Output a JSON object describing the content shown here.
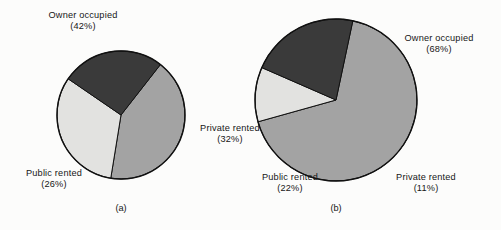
{
  "figure": {
    "background": "#fcfcfb",
    "outline_color": "#111111"
  },
  "palette": {
    "owner_occupied": "#a3a3a3",
    "private_rented": "#e2e2e0",
    "public_rented": "#3a3a3a"
  },
  "captions": {
    "left": "(a)",
    "right": "(b)"
  },
  "labels": {
    "a_owner_name": "Owner occupied",
    "a_owner_pct": "(42%)",
    "a_private_name": "Private rented",
    "a_private_pct": "(32%)",
    "a_public_name": "Public rented",
    "a_public_pct": "(26%)",
    "b_owner_name": "Owner occupied",
    "b_owner_pct": "(68%)",
    "b_private_name": "Private rented",
    "b_private_pct": "(11%)",
    "b_public_name": "Public rented",
    "b_public_pct": "(22%)"
  },
  "chart_data": [
    {
      "type": "pie",
      "id": "a",
      "title": "(a)",
      "categories": [
        "Owner occupied",
        "Private rented",
        "Public rented"
      ],
      "values": [
        42,
        32,
        26
      ],
      "value_labels": [
        "(42%)",
        "(32%)",
        "(26%)"
      ],
      "units": "percent",
      "colors": [
        "#a3a3a3",
        "#e2e2e0",
        "#3a3a3a"
      ],
      "start_angle_deg": 38,
      "direction": "clockwise",
      "center": [
        121,
        115
      ],
      "radius": 64,
      "legend": "none",
      "grid": false
    },
    {
      "type": "pie",
      "id": "b",
      "title": "(b)",
      "categories": [
        "Owner occupied",
        "Private rented",
        "Public rented"
      ],
      "values": [
        68,
        11,
        22
      ],
      "value_labels": [
        "(68%)",
        "(11%)",
        "(22%)"
      ],
      "units": "percent",
      "colors": [
        "#a3a3a3",
        "#e2e2e0",
        "#3a3a3a"
      ],
      "start_angle_deg": 12,
      "direction": "clockwise",
      "center": [
        336,
        100
      ],
      "radius": 81,
      "legend": "none",
      "grid": false
    }
  ]
}
